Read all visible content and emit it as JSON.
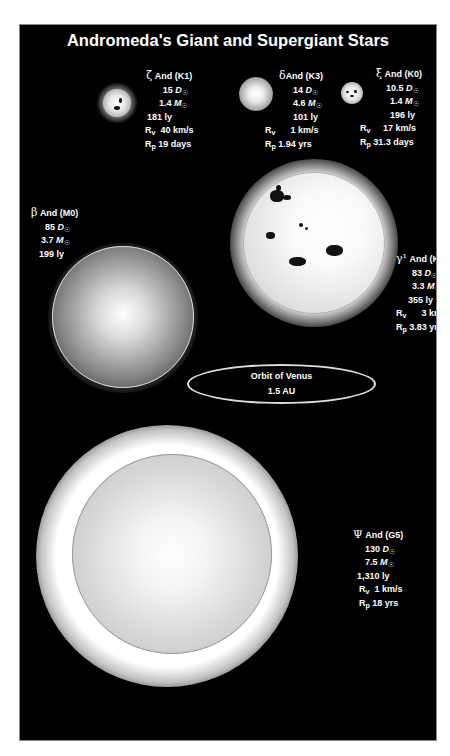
{
  "figure": {
    "title": "Andromeda's Giant and Supergiant Stars",
    "units": {
      "diameter": "D☉",
      "mass": "M☉",
      "radial_velocity_label": "R",
      "radial_velocity_sub": "v",
      "rotation_period_label": "R",
      "rotation_period_sub": "p"
    },
    "stars": [
      {
        "id": "zeta",
        "greek": "ζ",
        "name": "And (K1)",
        "diameter": "15",
        "mass": "1.4",
        "distance": "181 ly",
        "rv": "40 km/s",
        "rp": "19 days",
        "has_spots": true,
        "spectral_class": "K1"
      },
      {
        "id": "delta",
        "greek": "δ",
        "name": "And (K3)",
        "diameter": "14",
        "mass": "4.6",
        "distance": "101 ly",
        "rv": "1 km/s",
        "rp": "1.94 yrs",
        "has_spots": false,
        "spectral_class": "K3"
      },
      {
        "id": "xi",
        "greek": "ξ",
        "name": "And (K0)",
        "diameter": "10.5",
        "mass": "1.4",
        "distance": "196 ly",
        "rv": "17 km/s",
        "rp": "31.3 days",
        "has_spots": true,
        "spectral_class": "K0"
      },
      {
        "id": "beta",
        "greek": "β",
        "name": "And (M0)",
        "diameter": "85",
        "mass": "3.7",
        "distance": "199 ly",
        "has_spots": false,
        "spectral_class": "M0"
      },
      {
        "id": "gamma1",
        "greek": "γ¹",
        "name": "And (K3)",
        "diameter": "83",
        "mass": "3.3",
        "distance": "355 ly",
        "rv": "3 km/s",
        "rp": "3.83 yrs",
        "has_spots": true,
        "spectral_class": "K3"
      },
      {
        "id": "psi",
        "greek": "Ψ",
        "name": "And (G5)",
        "diameter": "130",
        "mass": "7.5",
        "distance": "1,310 ly",
        "rv": "1 km/s",
        "rp": "18 yrs",
        "has_spots": false,
        "spectral_class": "G5"
      }
    ],
    "orbit": {
      "label": "Orbit of Venus",
      "value": "1.5 AU"
    }
  }
}
